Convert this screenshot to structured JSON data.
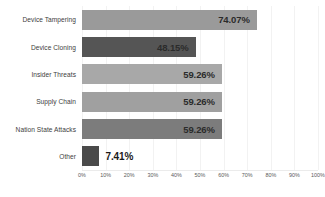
{
  "chart_data": {
    "type": "bar",
    "orientation": "horizontal",
    "title": "",
    "subtitle": "",
    "xlabel": "",
    "ylabel": "",
    "xlim": [
      0,
      100
    ],
    "grid": true,
    "legend": false,
    "categories": [
      "Device Tampering",
      "Device Cloning",
      "Insider Threats",
      "Supply Chain",
      "Nation State Attacks",
      "Other"
    ],
    "values": [
      74.07,
      48.15,
      59.26,
      59.26,
      59.26,
      7.41
    ],
    "value_labels": [
      "74.07%",
      "48.15%",
      "59.26%",
      "59.26%",
      "59.26%",
      "7.41%"
    ],
    "label_placement": [
      "inside",
      "inside",
      "inside",
      "inside",
      "inside",
      "outside"
    ],
    "bar_colors": [
      "#9a9a9a",
      "#555555",
      "#a8a8a8",
      "#a0a0a0",
      "#7c7c7c",
      "#4a4a4a"
    ],
    "xticks": [
      0,
      10,
      20,
      30,
      40,
      50,
      60,
      70,
      80,
      90,
      100
    ],
    "xtick_labels": [
      "0%",
      "10%",
      "20%",
      "30%",
      "40%",
      "50%",
      "60%",
      "70%",
      "80%",
      "90%",
      "100%"
    ],
    "background_color": "#ffffff",
    "gridline_color": "#f2f2f2",
    "axis_line_color": "#ebebeb",
    "value_text_color": "#2b2b2b",
    "category_text_color": "#3d3d3d",
    "tick_text_color": "#5a5a5a"
  }
}
